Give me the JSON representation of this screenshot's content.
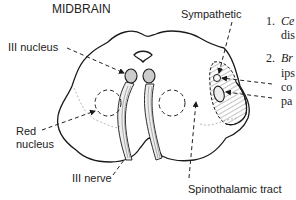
{
  "title": "MIDBRAIN",
  "labels": {
    "sympathetic": "Sympathetic",
    "iii_nucleus": "III nucleus",
    "red_nucleus_line1": "Red",
    "red_nucleus_line2": "nucleus",
    "iii_nerve": "III nerve",
    "spinothalamic": "Spinothalamic tract"
  },
  "side_text": {
    "item1_num": "1.",
    "item1_word": "Ce",
    "item1_line2": "dis",
    "item2_num": "2.",
    "item2_word": "Br",
    "item2_line2": "ips",
    "item2_line3": "co",
    "item2_line4": "pa"
  },
  "colors": {
    "ink": "#1a1a1a",
    "hatch": "#555555",
    "background": "#ffffff"
  }
}
